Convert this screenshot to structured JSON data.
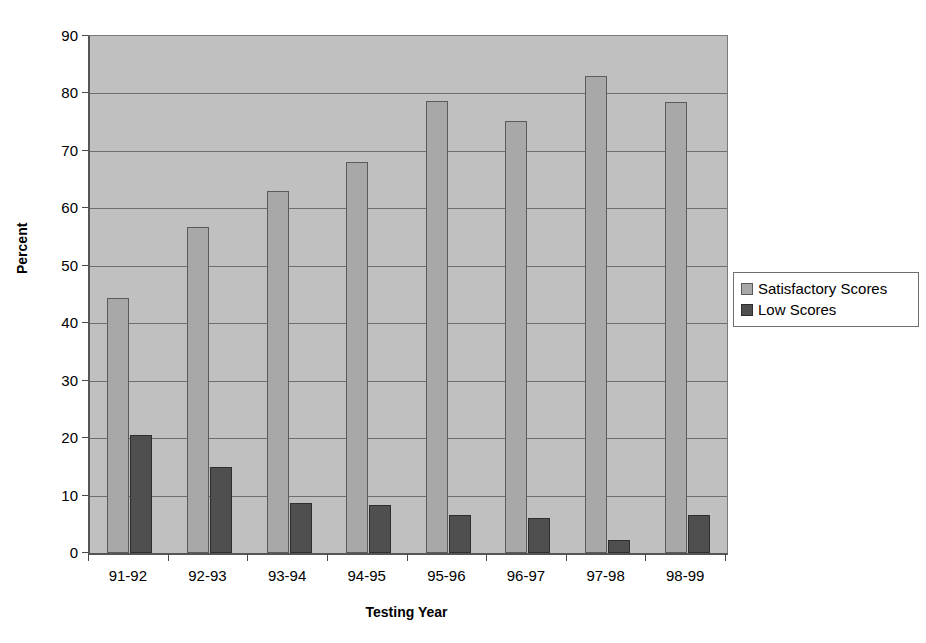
{
  "chart_data": {
    "type": "bar",
    "title": "",
    "xlabel": "Testing Year",
    "ylabel": "Percent",
    "categories": [
      "91-92",
      "92-93",
      "93-94",
      "94-95",
      "95-96",
      "96-97",
      "97-98",
      "98-99"
    ],
    "series": [
      {
        "name": "Satisfactory Scores",
        "color": "#a8a8a8",
        "values": [
          44.4,
          56.7,
          63.1,
          68.1,
          78.7,
          75.2,
          83.0,
          78.6
        ]
      },
      {
        "name": "Low Scores",
        "color": "#4f4f4f",
        "values": [
          20.6,
          15.0,
          8.7,
          8.4,
          6.7,
          6.1,
          2.2,
          6.7
        ]
      }
    ],
    "ylim": [
      0,
      90
    ],
    "ytick_values": [
      0,
      10,
      20,
      30,
      40,
      50,
      60,
      70,
      80,
      90
    ],
    "ytick_labels": [
      "0",
      "10",
      "20",
      "30",
      "40",
      "50",
      "60",
      "70",
      "80",
      "90"
    ],
    "grid": "horizontal",
    "legend_position": "right",
    "plot_background": "#c0c0c0",
    "figure_background": "#ffffff"
  },
  "legend": {
    "entries": [
      {
        "label": "Satisfactory Scores",
        "swatch": "satisfactory-swatch"
      },
      {
        "label": "Low Scores",
        "swatch": "low-swatch"
      }
    ]
  }
}
